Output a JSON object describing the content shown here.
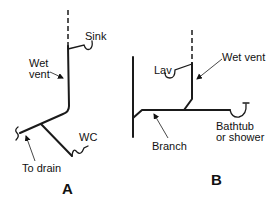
{
  "diagram_a": {
    "caption": "A",
    "labels": {
      "sink": "Sink",
      "wet_vent_line1": "Wet",
      "wet_vent_line2": "vent",
      "wc": "WC",
      "to_drain": "To drain"
    }
  },
  "diagram_b": {
    "caption": "B",
    "labels": {
      "lav": "Lav",
      "wet_vent": "Wet vent",
      "branch": "Branch",
      "bathtub_line1": "Bathtub",
      "bathtub_line2": "or shower"
    }
  },
  "colors": {
    "line": "#1a1a1a",
    "background": "#ffffff"
  }
}
